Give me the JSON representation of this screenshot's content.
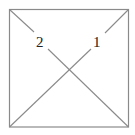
{
  "diagram": {
    "type": "square-with-diagonals",
    "stroke_color": "#888888",
    "labels": [
      {
        "id": "diagonal-2",
        "text": "2"
      },
      {
        "id": "diagonal-1",
        "text": "1"
      }
    ]
  }
}
